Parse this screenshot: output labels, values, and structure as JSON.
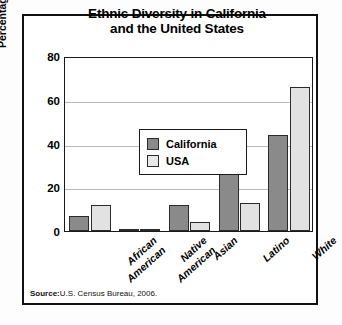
{
  "figure": {
    "title_line1": "Ethnic Diversity in California",
    "title_line2": "and the United States",
    "source_label": "Source:",
    "source_text": "U.S. Census Bureau, 2006."
  },
  "legend": {
    "position": "inside-top-left",
    "entries": [
      {
        "label": "California",
        "color": "#8a8a8a"
      },
      {
        "label": "USA",
        "color": "#e8e8e8"
      }
    ]
  },
  "axis": {
    "y_title": "Percentage of Population",
    "y_ticks": [
      "0",
      "20",
      "40",
      "60",
      "80"
    ]
  },
  "chart_data": {
    "type": "bar",
    "title": "Ethnic Diversity in California and the United States",
    "xlabel": "",
    "ylabel": "Percentage of Population",
    "ylim": [
      0,
      80
    ],
    "ytick_values": [
      0,
      20,
      40,
      60,
      80
    ],
    "grid": true,
    "legend_position": "upper left (inside plot)",
    "categories": [
      "African American",
      "Native American",
      "Asian",
      "Latino",
      "White"
    ],
    "category_lines": [
      [
        "African",
        "American"
      ],
      [
        "Native",
        "American"
      ],
      [
        "Asian"
      ],
      [
        "Latino"
      ],
      [
        "White"
      ]
    ],
    "series": [
      {
        "name": "California",
        "color": "#8a8a8a",
        "values": [
          7,
          1,
          12,
          34,
          44
        ]
      },
      {
        "name": "USA",
        "color": "#e2e2e2",
        "values": [
          12,
          1,
          4,
          13,
          66
        ]
      }
    ],
    "source": "Source: U.S. Census Bureau, 2006."
  }
}
